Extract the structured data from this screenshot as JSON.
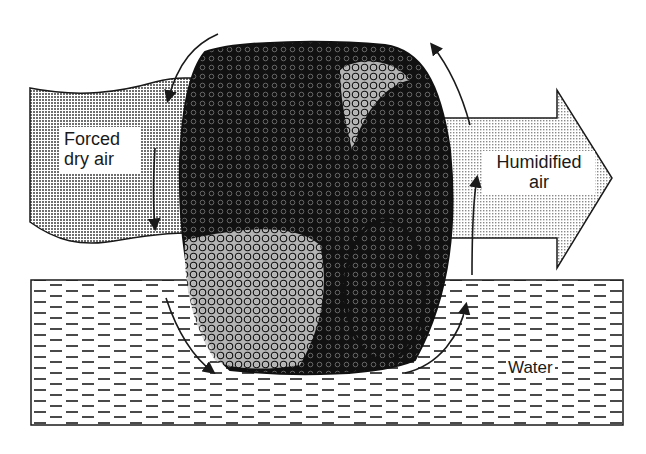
{
  "diagram": {
    "labels": {
      "inlet_line1": "Forced",
      "inlet_line2": "dry air",
      "outlet_line1": "Humidified",
      "outlet_line2": "air",
      "reservoir": "Water"
    },
    "components": [
      "inlet-air-stream",
      "rotating-wick-drum",
      "outlet-air-arrow",
      "water-reservoir",
      "rotation-arrows"
    ],
    "colors": {
      "ink": "#1a1a1a",
      "inlet_fill": "#9a9a9a",
      "outlet_fill": "#d4d4d4",
      "water_dash": "#555555",
      "background": "#ffffff"
    }
  }
}
